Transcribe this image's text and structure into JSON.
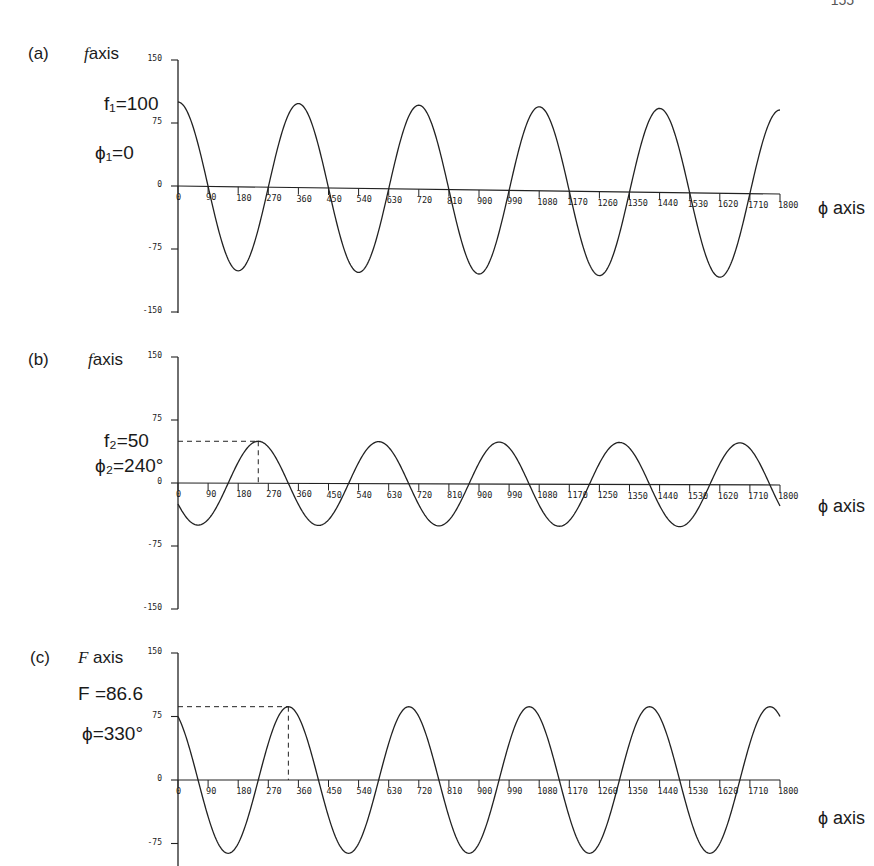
{
  "page": {
    "header_right": "155",
    "x_axis_label": "ϕ axis"
  },
  "panels": [
    {
      "id": "a",
      "label": "(a)",
      "axis_var": "f",
      "axis_word": "axis",
      "annotation_value": "f₁=100",
      "annotation_phase": "ϕ₁=0",
      "amplitude": 100,
      "phase_deg": 0,
      "show_dashes": false
    },
    {
      "id": "b",
      "label": "(b)",
      "axis_var": "f",
      "axis_word": "axis",
      "annotation_value": "f₂=50",
      "annotation_phase": "ϕ₂=240°",
      "amplitude": 50,
      "phase_deg": 240,
      "show_dashes": true
    },
    {
      "id": "c",
      "label": "(c)",
      "axis_var": "F",
      "axis_word": " axis",
      "annotation_value": "F =86.6",
      "annotation_phase": "ϕ=330°",
      "amplitude": 86.6,
      "phase_deg": 330,
      "show_dashes": true
    }
  ],
  "chart_data": [
    {
      "type": "line",
      "title": "(a) f axis",
      "xlabel": "ϕ axis",
      "ylabel": "f axis",
      "ylim": [
        -150,
        150
      ],
      "xlim": [
        0,
        1800
      ],
      "yticks": [
        150,
        75,
        0,
        -75,
        -150
      ],
      "xticks": [
        "0",
        "90",
        "180",
        "270",
        "360",
        "450",
        "540",
        "630",
        "720",
        "810",
        "900",
        "990",
        "1080",
        "1170",
        "1260",
        "1350",
        "1440",
        "1530",
        "1620",
        "1710",
        "1800"
      ],
      "series": [
        {
          "name": "f1 = 100 cos(ϕ)",
          "amplitude": 100,
          "phase_deg": 0
        }
      ],
      "annotations": [
        "f1=100",
        "ϕ1=0"
      ],
      "grid": false
    },
    {
      "type": "line",
      "title": "(b) f axis",
      "xlabel": "ϕ axis",
      "ylabel": "f axis",
      "ylim": [
        -150,
        150
      ],
      "xlim": [
        0,
        1800
      ],
      "yticks": [
        150,
        75,
        0,
        -75,
        -150
      ],
      "xticks": [
        "0",
        "90",
        "180",
        "270",
        "360",
        "450",
        "540",
        "630",
        "720",
        "810",
        "900",
        "990",
        "1080",
        "1170",
        "1250",
        "1350",
        "1440",
        "1530",
        "1620",
        "1710",
        "1800"
      ],
      "series": [
        {
          "name": "f2 = 50 cos(ϕ - 240°)",
          "amplitude": 50,
          "phase_deg": 240
        }
      ],
      "annotations": [
        "f2=50",
        "ϕ2=240°"
      ],
      "grid": false
    },
    {
      "type": "line",
      "title": "(c) F axis",
      "xlabel": "ϕ axis",
      "ylabel": "F axis",
      "ylim": [
        -150,
        150
      ],
      "xlim": [
        0,
        1800
      ],
      "yticks": [
        150,
        75,
        0,
        -75
      ],
      "xticks": [
        "0",
        "90",
        "180",
        "270",
        "360",
        "450",
        "540",
        "630",
        "720",
        "810",
        "900",
        "990",
        "1080",
        "1170",
        "1260",
        "1350",
        "1440",
        "1530",
        "1620",
        "1710",
        "1800"
      ],
      "series": [
        {
          "name": "F = 86.6 cos(ϕ - 330°)",
          "amplitude": 86.6,
          "phase_deg": 330
        }
      ],
      "annotations": [
        "F=86.6",
        "ϕ=330°"
      ],
      "grid": false
    }
  ]
}
